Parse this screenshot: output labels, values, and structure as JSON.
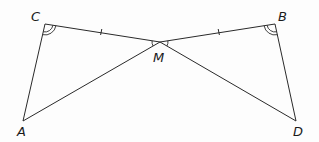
{
  "diagram": {
    "type": "geometry-figure",
    "points": {
      "C": {
        "label": "C",
        "x": 45,
        "y": 24
      },
      "B": {
        "label": "B",
        "x": 275,
        "y": 24
      },
      "M": {
        "label": "M",
        "x": 160,
        "y": 42
      },
      "A": {
        "label": "A",
        "x": 23,
        "y": 121
      },
      "D": {
        "label": "D",
        "x": 296,
        "y": 121
      }
    },
    "segments": [
      [
        "C",
        "M"
      ],
      [
        "M",
        "B"
      ],
      [
        "C",
        "A"
      ],
      [
        "A",
        "M"
      ],
      [
        "M",
        "D"
      ],
      [
        "B",
        "D"
      ]
    ],
    "equal_length_marks": [
      [
        "C",
        "M"
      ],
      [
        "M",
        "B"
      ]
    ],
    "angle_marks": {
      "C": "double-arc",
      "B": "double-arc",
      "CMA": "single-arc",
      "BMD": "single-arc"
    },
    "labels": {
      "C": "C",
      "B": "B",
      "M": "M",
      "A": "A",
      "D": "D"
    },
    "stroke_color": "#2a2a2a"
  }
}
